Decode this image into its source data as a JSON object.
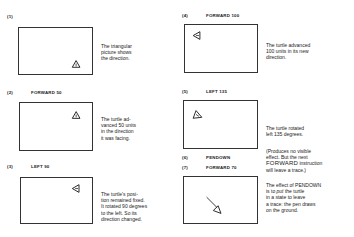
{
  "steps": [
    {
      "num": "(1)",
      "command": "",
      "desc": "The triangular\npicture shows\nthe direction."
    },
    {
      "num": "(2)",
      "command": "FORWARD 50",
      "desc": "The turtle ad-\nvanced 50 units\nin the direction\nit was facing."
    },
    {
      "num": "(3)",
      "command": "LEFT 90",
      "desc": "The turtle's posi-\ntion remained fixed.\nIt rotated 90 degrees\nto the left. So its\ndirection changed."
    },
    {
      "num": "(4)",
      "command": "FORWARD 100",
      "desc": "The turtle advanced\n100 units in its new\ndirection."
    },
    {
      "num": "(5)",
      "command": "LEFT 135",
      "desc": "The turtle rotated\nleft 135 degrees."
    },
    {
      "num": "(6)",
      "command": "PENDOWN",
      "desc_line1": "(Produces no visible",
      "desc_line2": "effect. But the next",
      "desc_big": "FORWARD",
      "desc_line3_rest": " instruction",
      "desc_line4": "will leave a trace.)"
    },
    {
      "num": "(7)",
      "command": "FORWARD 70",
      "desc_line1": "The effect of PENDOWN",
      "desc_line2_pre": "is to ",
      "desc_line2_em": "put",
      "desc_line2_post": " the turtle",
      "desc_line3": "in a state to leave",
      "desc_line4": "a trace: the pen draws",
      "desc_line5": "on the ground."
    }
  ],
  "colors": {
    "ink": "#222222",
    "border": "#333333",
    "background": "#ffffff"
  }
}
